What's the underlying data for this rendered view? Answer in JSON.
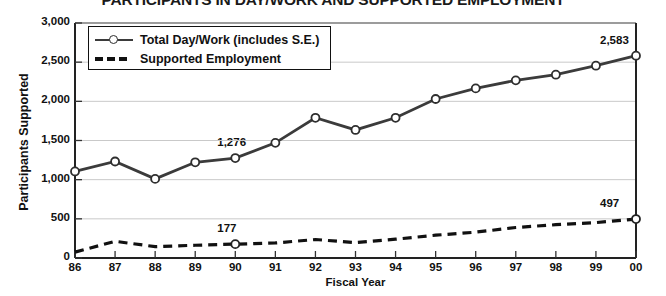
{
  "chart_data": {
    "type": "line",
    "title": "PARTICIPANTS IN DAY/WORK AND SUPPORTED EMPLOYMENT",
    "xlabel": "Fiscal Year",
    "ylabel": "Participants Supported",
    "categories": [
      "86",
      "87",
      "88",
      "89",
      "90",
      "91",
      "92",
      "93",
      "94",
      "95",
      "96",
      "97",
      "98",
      "99",
      "00"
    ],
    "ylim": [
      0,
      3000
    ],
    "ytick_labels": [
      "0",
      "500",
      "1,000",
      "1,500",
      "2,000",
      "2,500",
      "3,000"
    ],
    "ytick_values": [
      0,
      500,
      1000,
      1500,
      2000,
      2500,
      3000
    ],
    "grid": true,
    "legend_position": "top-left",
    "series": [
      {
        "name": "Total Day/Work (includes S.E.)",
        "style": "solid-with-circle-markers",
        "color": "#3b3b3b",
        "values": [
          1105,
          1232,
          1010,
          1222,
          1276,
          1470,
          1790,
          1635,
          1790,
          2030,
          2165,
          2268,
          2340,
          2455,
          2583
        ]
      },
      {
        "name": "Supported Employment",
        "style": "dashed",
        "color": "#111111",
        "values": [
          75,
          213,
          145,
          163,
          177,
          192,
          236,
          196,
          240,
          291,
          330,
          389,
          425,
          452,
          497
        ]
      }
    ],
    "annotations": [
      {
        "label": "1,276",
        "series": "Total Day/Work (includes S.E.)",
        "category": "90",
        "value": 1276
      },
      {
        "label": "2,583",
        "series": "Total Day/Work (includes S.E.)",
        "category": "00",
        "value": 2583
      },
      {
        "label": "177",
        "series": "Supported Employment",
        "category": "90",
        "value": 177
      },
      {
        "label": "497",
        "series": "Supported Employment",
        "category": "00",
        "value": 497
      }
    ]
  },
  "legend": {
    "items": [
      {
        "label": "Total Day/Work (includes S.E.)"
      },
      {
        "label": "Supported Employment"
      }
    ]
  }
}
